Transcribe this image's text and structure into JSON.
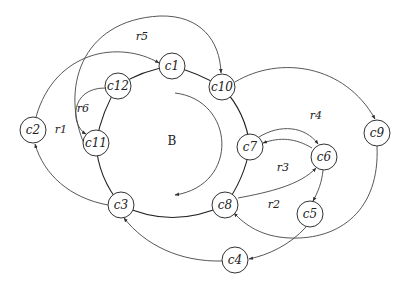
{
  "diagram": {
    "center_label": "B",
    "colors": {
      "stroke": "#333333",
      "background": "#ffffff",
      "text": "#222222"
    },
    "nodes": [
      {
        "id": "c1",
        "label": "c1",
        "x": 172,
        "y": 66
      },
      {
        "id": "c10",
        "label": "c10",
        "x": 222,
        "y": 87
      },
      {
        "id": "c12",
        "label": "c12",
        "x": 118,
        "y": 86
      },
      {
        "id": "c11",
        "label": "c11",
        "x": 96,
        "y": 143
      },
      {
        "id": "c2",
        "label": "c2",
        "x": 33,
        "y": 130
      },
      {
        "id": "c7",
        "label": "c7",
        "x": 250,
        "y": 147
      },
      {
        "id": "c6",
        "label": "c6",
        "x": 324,
        "y": 157
      },
      {
        "id": "c9",
        "label": "c9",
        "x": 377,
        "y": 133
      },
      {
        "id": "c8",
        "label": "c8",
        "x": 225,
        "y": 205
      },
      {
        "id": "c5",
        "label": "c5",
        "x": 310,
        "y": 214
      },
      {
        "id": "c3",
        "label": "c3",
        "x": 121,
        "y": 205
      },
      {
        "id": "c4",
        "label": "c4",
        "x": 235,
        "y": 260
      }
    ],
    "regions": [
      {
        "label": "r5",
        "x": 142,
        "y": 36
      },
      {
        "label": "r1",
        "x": 61,
        "y": 129
      },
      {
        "label": "r6",
        "x": 83,
        "y": 108
      },
      {
        "label": "r4",
        "x": 316,
        "y": 115
      },
      {
        "label": "r3",
        "x": 283,
        "y": 167
      },
      {
        "label": "r2",
        "x": 274,
        "y": 204
      }
    ],
    "edges": [
      {
        "from": "c3",
        "to": "c2",
        "note": "arc r1 side"
      },
      {
        "from": "c2",
        "to": "c1",
        "note": "big arc over top"
      },
      {
        "from": "c11",
        "to": "c10",
        "note": "r5 big arc",
        "directed_to": "c10"
      },
      {
        "from": "c12",
        "to": "c11",
        "note": "r6 arc"
      },
      {
        "from": "c10",
        "to": "c9",
        "note": "r4 arc"
      },
      {
        "from": "c7",
        "to": "c6",
        "note": "double arc top"
      },
      {
        "from": "c6",
        "to": "c7",
        "note": "double arc inner"
      },
      {
        "from": "c8",
        "to": "c6",
        "note": "r3 arc"
      },
      {
        "from": "c6",
        "to": "c5"
      },
      {
        "from": "c9",
        "to": "c8",
        "note": "big arc bottom"
      },
      {
        "from": "c5",
        "to": "c4"
      },
      {
        "from": "c4",
        "to": "c3"
      }
    ]
  }
}
